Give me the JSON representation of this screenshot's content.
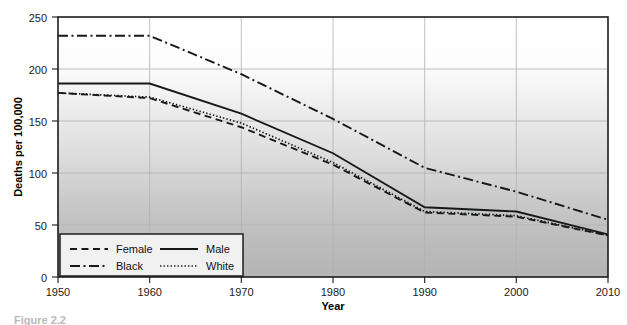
{
  "chart_data": {
    "type": "line",
    "title": "",
    "xlabel": "Year",
    "ylabel": "Deaths per 100,000",
    "xlim": [
      1950,
      2010
    ],
    "ylim": [
      0,
      250
    ],
    "grid": true,
    "legend_position": "bottom-left",
    "x": [
      1950,
      1960,
      1970,
      1980,
      1990,
      2000,
      2010
    ],
    "xticklabels": [
      "1950",
      "1960",
      "1970",
      "1980",
      "1990",
      "2000",
      "2010"
    ],
    "yticks": [
      0,
      50,
      100,
      150,
      200,
      250
    ],
    "yticklabels": [
      "0",
      "50",
      "100",
      "150",
      "200",
      "250"
    ],
    "series": [
      {
        "name": "Female",
        "style": "dashed",
        "values": [
          177,
          172,
          144,
          108,
          62,
          58,
          40
        ]
      },
      {
        "name": "Male",
        "style": "solid",
        "values": [
          186,
          186,
          157,
          119,
          67,
          63,
          41
        ]
      },
      {
        "name": "Black",
        "style": "dash-dot",
        "values": [
          232,
          232,
          195,
          152,
          105,
          82,
          55
        ]
      },
      {
        "name": "White",
        "style": "dotted",
        "values": [
          177,
          173,
          148,
          110,
          63,
          59,
          40
        ]
      }
    ]
  },
  "axes": {
    "y_axis_title": "Deaths per 100,000",
    "x_axis_title": "Year",
    "y_tick_labels": [
      "250",
      "200",
      "150",
      "100",
      "50",
      "0"
    ],
    "x_tick_labels": [
      "1950",
      "1960",
      "1970",
      "1980",
      "1990",
      "2000",
      "2010"
    ]
  },
  "legend": {
    "entries": [
      {
        "label": "Female",
        "style": "dashed"
      },
      {
        "label": "Male",
        "style": "solid"
      },
      {
        "label": "Black",
        "style": "dash-dot"
      },
      {
        "label": "White",
        "style": "dotted"
      }
    ]
  },
  "caption": {
    "text": "Figure 2.2"
  },
  "colors": {
    "line": "#16181a",
    "grid": "#b0b0b0",
    "frame": "#1c1c1c",
    "plot_bg_top": "#ffffff",
    "plot_bg_bottom": "#b5b5b5",
    "legend_bg": "#f1f1f1",
    "page_bg": "#ffffff"
  }
}
